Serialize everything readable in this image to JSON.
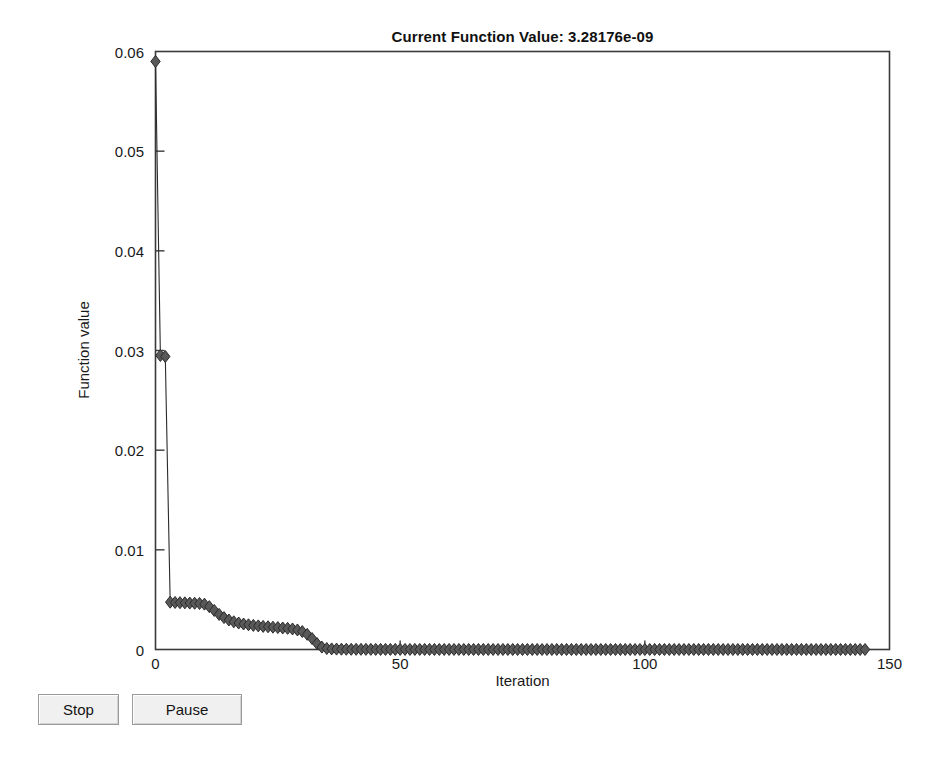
{
  "window": {
    "title": "Optimization Progress Figure"
  },
  "chart_data": {
    "type": "scatter",
    "title": "Current Function Value: 3.28176e-09",
    "xlabel": "Iteration",
    "ylabel": "Function value",
    "xlim": [
      0,
      150
    ],
    "ylim": [
      0,
      0.06
    ],
    "xticks": [
      0,
      50,
      100,
      150
    ],
    "xtick_labels": [
      "0",
      "50",
      "100",
      "150"
    ],
    "yticks": [
      0,
      0.01,
      0.02,
      0.03,
      0.04,
      0.05,
      0.06
    ],
    "ytick_labels": [
      "0",
      "0.01",
      "0.02",
      "0.03",
      "0.04",
      "0.05",
      "0.06"
    ],
    "grid": false,
    "legend": null,
    "marker": "diamond",
    "marker_color": "#595959",
    "marker_edge_color": "#2b2b2b",
    "marker_size": 6,
    "series": [
      {
        "name": "Current Function Value",
        "x": [
          0,
          1,
          2,
          3,
          4,
          5,
          6,
          7,
          8,
          9,
          10,
          11,
          12,
          13,
          14,
          15,
          16,
          17,
          18,
          19,
          20,
          21,
          22,
          23,
          24,
          25,
          26,
          27,
          28,
          29,
          30,
          31,
          32,
          33,
          34,
          35,
          36,
          37,
          38,
          39,
          40,
          41,
          42,
          43,
          44,
          45,
          46,
          47,
          48,
          49,
          50,
          51,
          52,
          53,
          54,
          55,
          56,
          57,
          58,
          59,
          60,
          61,
          62,
          63,
          64,
          65,
          66,
          67,
          68,
          69,
          70,
          71,
          72,
          73,
          74,
          75,
          76,
          77,
          78,
          79,
          80,
          81,
          82,
          83,
          84,
          85,
          86,
          87,
          88,
          89,
          90,
          91,
          92,
          93,
          94,
          95,
          96,
          97,
          98,
          99,
          100,
          101,
          102,
          103,
          104,
          105,
          106,
          107,
          108,
          109,
          110,
          111,
          112,
          113,
          114,
          115,
          116,
          117,
          118,
          119,
          120,
          121,
          122,
          123,
          124,
          125,
          126,
          127,
          128,
          129,
          130,
          131,
          132,
          133,
          134,
          135,
          136,
          137,
          138,
          139,
          140,
          141,
          142,
          143,
          144,
          145
        ],
        "y": [
          0.059,
          0.0295,
          0.0294,
          0.00475,
          0.00472,
          0.0047,
          0.00468,
          0.00466,
          0.00464,
          0.00462,
          0.00455,
          0.0043,
          0.00392,
          0.00352,
          0.0032,
          0.00296,
          0.00278,
          0.00266,
          0.00256,
          0.00248,
          0.00242,
          0.00237,
          0.00232,
          0.00228,
          0.00224,
          0.0022,
          0.00216,
          0.00212,
          0.00206,
          0.00196,
          0.0018,
          0.00152,
          0.0011,
          0.0006,
          0.00024,
          0.0001,
          6e-05,
          4e-05,
          3e-05,
          2.5e-05,
          2e-05,
          1.8e-05,
          1.6e-05,
          1.4e-05,
          1.3e-05,
          1.2e-05,
          1.1e-05,
          1e-05,
          9.5e-06,
          9e-06,
          8.5e-06,
          8e-06,
          7.5e-06,
          7e-06,
          6.6e-06,
          6.2e-06,
          5.8e-06,
          5.4e-06,
          5e-06,
          4.7e-06,
          4.4e-06,
          4.1e-06,
          3.8e-06,
          3.6e-06,
          3.3e-06,
          3.1e-06,
          2.9e-06,
          2.7e-06,
          2.5e-06,
          2.3e-06,
          2.2e-06,
          2e-06,
          1.9e-06,
          1.7e-06,
          1.6e-06,
          1.5e-06,
          1.4e-06,
          1.3e-06,
          1.2e-06,
          1.1e-06,
          1e-06,
          9.5e-07,
          9e-07,
          8.5e-07,
          8e-07,
          7.5e-07,
          7e-07,
          6.5e-07,
          6e-07,
          5.6e-07,
          5.2e-07,
          4.8e-07,
          4.5e-07,
          4.2e-07,
          3.9e-07,
          3.6e-07,
          3.3e-07,
          3e-07,
          2.8e-07,
          2.6e-07,
          2.4e-07,
          2.2e-07,
          2e-07,
          1.9e-07,
          1.7e-07,
          1.6e-07,
          1.5e-07,
          1.4e-07,
          1.3e-07,
          1.2e-07,
          1.1e-07,
          1e-07,
          9.3e-08,
          8.6e-08,
          8e-08,
          7.4e-08,
          6.8e-08,
          6.3e-08,
          5.8e-08,
          5.4e-08,
          5e-08,
          4.6e-08,
          4.2e-08,
          3.9e-08,
          3.6e-08,
          3.3e-08,
          3e-08,
          2.8e-08,
          2.6e-08,
          2.4e-08,
          2.2e-08,
          2e-08,
          1.8e-08,
          1.7e-08,
          1.55e-08,
          1.42e-08,
          1.3e-08,
          1.19e-08,
          1.09e-08,
          1e-08,
          7.5e-09,
          5.8e-09,
          4.6e-09,
          3.8e-09,
          3.3e-09,
          3.28176e-09
        ]
      }
    ],
    "current_value": "3.28176e-09"
  },
  "buttons": {
    "stop_label": "Stop",
    "pause_label": "Pause"
  }
}
